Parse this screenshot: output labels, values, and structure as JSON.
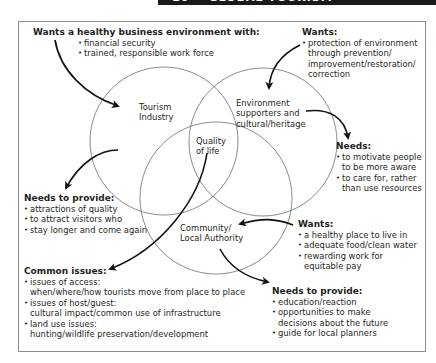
{
  "page_header": {
    "chapter_number": "10",
    "chapter_title": "GLOBAL TOURISM"
  },
  "diagram": {
    "circles": [
      {
        "id": "tourism",
        "label_lines": [
          "Tourism",
          "Industry"
        ]
      },
      {
        "id": "environment",
        "label_lines": [
          "Environment",
          "supporters and",
          "cultural/heritage"
        ]
      },
      {
        "id": "community",
        "label_lines": [
          "Community/",
          "Local Authority"
        ]
      }
    ],
    "center_label_lines": [
      "Quality",
      "of life"
    ],
    "blocks": {
      "tourism_wants": {
        "heading": "Wants a healthy business environment with:",
        "items": [
          "financial security",
          "trained, responsible work force"
        ]
      },
      "environment_wants": {
        "heading": "Wants:",
        "items": [
          {
            "line1": "protection of environment",
            "cont": [
              "through prevention/",
              "improvement/restoration/",
              "correction"
            ]
          }
        ]
      },
      "environment_needs": {
        "heading": "Needs:",
        "items": [
          {
            "line1": "to motivate people",
            "cont": [
              "to be more aware"
            ]
          },
          {
            "line1": "to care for, rather",
            "cont": [
              "than use resources"
            ]
          }
        ]
      },
      "tourism_needs": {
        "heading": "Needs to provide:",
        "items": [
          "attractions of quality",
          "to attract visitors who",
          "stay longer and come again"
        ]
      },
      "community_wants": {
        "heading": "Wants:",
        "items": [
          {
            "line1": "a healthy place to live in",
            "cont": []
          },
          {
            "line1": "adequate food/clean water",
            "cont": []
          },
          {
            "line1": "rewarding work for",
            "cont": [
              "equitable pay"
            ]
          }
        ]
      },
      "common_issues": {
        "heading": "Common issues:",
        "items": [
          {
            "line1": "issues of access:",
            "cont": [
              "when/where/how tourists move from place to place"
            ]
          },
          {
            "line1": "issues of host/guest:",
            "cont": [
              "cultural impact/common use of infrastructure"
            ]
          },
          {
            "line1": "land use issues:",
            "cont": [
              "hunting/wildlife preservation/development"
            ]
          }
        ]
      },
      "community_needs": {
        "heading": "Needs to provide:",
        "items": [
          {
            "line1": "education/reaction",
            "cont": []
          },
          {
            "line1": "opportunities to make",
            "cont": [
              "decisions about the future"
            ]
          },
          {
            "line1": "guide for local planners",
            "cont": []
          }
        ]
      }
    },
    "colors": {
      "text": "#231f20",
      "circle_stroke": "#6d6d6d",
      "arrow": "#111111",
      "frame": "#8c8c8c",
      "header_bar": "#1a1a1a"
    }
  }
}
